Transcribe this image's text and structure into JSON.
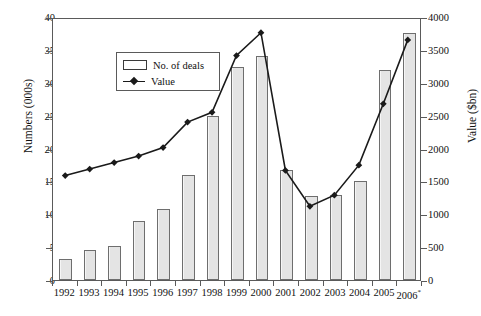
{
  "chart_data": {
    "type": "bar",
    "title": "",
    "xlabel": "",
    "ylabel": "Numbers (000s)",
    "y2label": "Value ($bn)",
    "grid": false,
    "legend_position": "top-left",
    "categories": [
      "1992",
      "1993",
      "1994",
      "1995",
      "1996",
      "1997",
      "1998",
      "1999",
      "2000",
      "2001",
      "2002",
      "2003",
      "2004",
      "2005",
      "2006*"
    ],
    "ylim": [
      0,
      40
    ],
    "yticks": [
      0,
      5,
      10,
      15,
      20,
      25,
      30,
      35,
      40
    ],
    "y2lim": [
      0,
      4000
    ],
    "y2ticks": [
      0,
      500,
      1000,
      1500,
      2000,
      2500,
      3000,
      3500,
      4000
    ],
    "series": [
      {
        "name": "No. of deals",
        "type": "bar",
        "axis": "left",
        "unit": "000s",
        "values": [
          3.2,
          4.6,
          5.1,
          9.0,
          10.8,
          16.0,
          25.0,
          32.4,
          34.1,
          16.8,
          12.8,
          13.0,
          15.0,
          32.0,
          37.5
        ]
      },
      {
        "name": "Value",
        "type": "line",
        "axis": "right",
        "unit": "$bn",
        "marker": "diamond",
        "values": [
          1600,
          1700,
          1800,
          1900,
          2030,
          2420,
          2570,
          3440,
          3790,
          1680,
          1130,
          1300,
          1760,
          2700,
          3680
        ]
      }
    ],
    "annotations": [
      "2006 figure marked with an asterisk"
    ]
  },
  "legend": {
    "items": [
      {
        "label": "No. of deals",
        "marker": "bar-swatch"
      },
      {
        "label": "Value",
        "marker": "line-diamond-swatch"
      }
    ]
  },
  "axes": {
    "left_title": "Numbers (000s)",
    "right_title": "Value ($bn)",
    "left_ticks": [
      "0",
      "5",
      "10",
      "15",
      "20",
      "25",
      "30",
      "35",
      "40"
    ],
    "right_ticks": [
      "0",
      "500",
      "1000",
      "1500",
      "2000",
      "2500",
      "3000",
      "3500",
      "4000"
    ],
    "x_ticks": [
      "1992",
      "1993",
      "1994",
      "1995",
      "1996",
      "1997",
      "1998",
      "1999",
      "2000",
      "2001",
      "2002",
      "2003",
      "2004",
      "2005",
      "2006"
    ],
    "x_last_superscript": "*"
  },
  "colors": {
    "bar_fill": "#e4e4e4",
    "bar_stroke": "#6e6e6e",
    "line": "#1a1a1a",
    "axis": "#5a5a5a",
    "text": "#111111",
    "background": "#ffffff"
  }
}
